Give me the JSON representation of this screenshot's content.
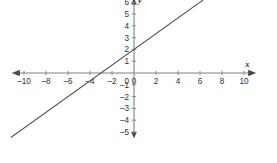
{
  "chart_data": {
    "type": "line",
    "title": "",
    "xlabel": "x",
    "ylabel": "y",
    "xlim": [
      -11.2,
      11.2
    ],
    "ylim": [
      -5.6,
      6.4
    ],
    "grid": false,
    "legend": null,
    "axis_labels": {
      "x": "x",
      "y": "y"
    },
    "x_ticks": [
      -10,
      -8,
      -6,
      -4,
      -2,
      0,
      2,
      4,
      6,
      8,
      10
    ],
    "x_tick_labels": [
      "–10",
      "–8",
      "–6",
      "–4",
      "–2",
      "0",
      "2",
      "4",
      "6",
      "8",
      "10"
    ],
    "y_ticks": [
      -5,
      -4,
      -3,
      -2,
      -1,
      1,
      2,
      3,
      4,
      5,
      6
    ],
    "y_tick_labels": [
      "–5",
      "–4",
      "–3",
      "–2",
      "–1",
      "1",
      "2",
      "3",
      "4",
      "5",
      "6"
    ],
    "series": [
      {
        "name": "line",
        "slope": 0.6667,
        "intercept": 2,
        "x_intercept": -3,
        "y_intercept": 2,
        "equation": "y = (2/3)x + 2",
        "color": "#58585c",
        "points": [
          {
            "x": -11.2,
            "y": -5.47
          },
          {
            "x": -3,
            "y": 0
          },
          {
            "x": 0,
            "y": 2
          },
          {
            "x": 6.6,
            "y": 6.4
          }
        ]
      }
    ],
    "colors": {
      "axis": "#808080",
      "line": "#58585c",
      "text": "#303030",
      "background": "#ffffff"
    }
  },
  "figure": {
    "origin_px": {
      "x": 134,
      "y": 73
    },
    "unit_px": {
      "x": 11.0,
      "y": 11.8
    }
  }
}
